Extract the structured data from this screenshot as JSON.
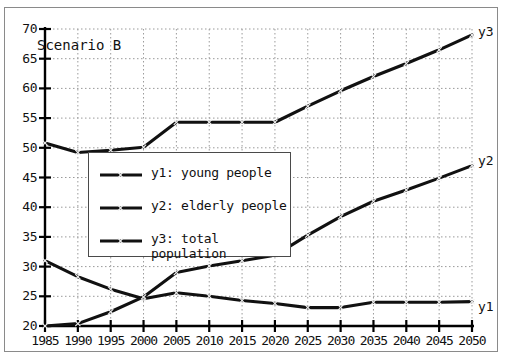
{
  "annotations": {
    "scenario_label": "Scenario B"
  },
  "legend": {
    "items": [
      {
        "key": "y1",
        "label": "y1: young people"
      },
      {
        "key": "y2",
        "label": "y2: elderly people"
      },
      {
        "key": "y3",
        "label": "y3: total\npopulation"
      }
    ]
  },
  "series_end_labels": {
    "y1": "y1",
    "y2": "y2",
    "y3": "y3"
  },
  "chart_data": {
    "type": "line",
    "title": "",
    "subtitle": "",
    "xlabel": "",
    "ylabel": "",
    "xlim": [
      1985,
      2050
    ],
    "ylim": [
      20,
      70
    ],
    "grid": true,
    "legend_position": "center-left",
    "x": [
      1985,
      1990,
      1995,
      2000,
      2005,
      2010,
      2015,
      2020,
      2025,
      2030,
      2035,
      2040,
      2045,
      2050
    ],
    "xticks": [
      "1985",
      "1990",
      "1995",
      "2000",
      "2005",
      "2010",
      "2015",
      "2020",
      "2025",
      "2030",
      "2035",
      "2040",
      "2045",
      "2050"
    ],
    "yticks": [
      "20",
      "25",
      "30",
      "35",
      "40",
      "45",
      "50",
      "55",
      "60",
      "65",
      "70"
    ],
    "series": [
      {
        "name": "y1: young people",
        "short": "y1",
        "values": [
          31.0,
          28.3,
          26.2,
          24.6,
          25.6,
          25.0,
          24.3,
          23.8,
          23.1,
          23.1,
          24.0,
          24.0,
          24.0,
          24.1
        ]
      },
      {
        "name": "y2: elderly people",
        "short": "y2",
        "values": [
          20.0,
          20.4,
          22.4,
          24.9,
          29.0,
          30.1,
          31.0,
          31.9,
          35.3,
          38.4,
          41.0,
          42.9,
          44.9,
          47.0
        ]
      },
      {
        "name": "y3: total population",
        "short": "y3",
        "values": [
          50.8,
          49.2,
          49.6,
          50.1,
          54.3,
          54.3,
          54.3,
          54.3,
          57.0,
          59.6,
          62.0,
          64.2,
          66.5,
          69.0
        ]
      }
    ]
  },
  "colors": {
    "line": "#111111",
    "grid": "#9a9a9a",
    "axis": "#000000",
    "frame": "#8a8a8a",
    "background": "#ffffff"
  }
}
